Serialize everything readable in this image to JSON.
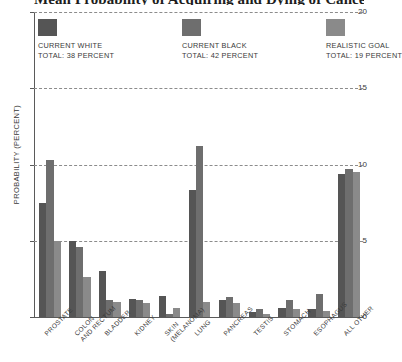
{
  "chart_data": {
    "type": "bar",
    "title": "Mean Probability of Acquiring and Dying of Cancer by Site",
    "xlabel": "",
    "ylabel": "PROBABILITY (PERCENT)",
    "ylim": [
      0,
      20
    ],
    "yticks": [
      0,
      5,
      10,
      15,
      20
    ],
    "grid": true,
    "legend_position": "top-inside",
    "categories": [
      "PROSTATE",
      "COLON AND RECTUM",
      "BLADDER",
      "KIDNEY",
      "SKIN (MELANOMA)",
      "LUNG",
      "PANCREAS",
      "TESTIS",
      "STOMACH",
      "ESOPHAGUS",
      "ALL OTHER"
    ],
    "series": [
      {
        "name": "CURRENT WHITE",
        "total_label": "TOTAL: 38 PERCENT",
        "color": "#555555",
        "values": [
          7.5,
          5.0,
          3.0,
          1.2,
          1.4,
          8.3,
          1.1,
          0.3,
          0.6,
          0.5,
          9.4
        ]
      },
      {
        "name": "CURRENT BLACK",
        "total_label": "TOTAL: 42 PERCENT",
        "color": "#6e6e6e",
        "values": [
          10.3,
          4.6,
          1.1,
          1.1,
          0.2,
          11.2,
          1.3,
          0.5,
          1.1,
          1.5,
          9.7
        ]
      },
      {
        "name": "REALISTIC GOAL",
        "total_label": "TOTAL: 19 PERCENT",
        "color": "#8a8a8a",
        "values": [
          5.0,
          2.6,
          1.0,
          0.9,
          0.6,
          1.0,
          0.9,
          0.2,
          0.5,
          0.4,
          9.5
        ]
      }
    ]
  },
  "legend": {
    "items": [
      {
        "label": "CURRENT WHITE",
        "total": "TOTAL: 38 PERCENT"
      },
      {
        "label": "CURRENT BLACK",
        "total": "TOTAL: 42 PERCENT"
      },
      {
        "label": "REALISTIC GOAL",
        "total": "TOTAL: 19 PERCENT"
      }
    ]
  },
  "axis": {
    "y_title": "PROBABILITY (PERCENT)",
    "y_ticks": [
      "20",
      "15",
      "10",
      "5",
      "0"
    ]
  }
}
